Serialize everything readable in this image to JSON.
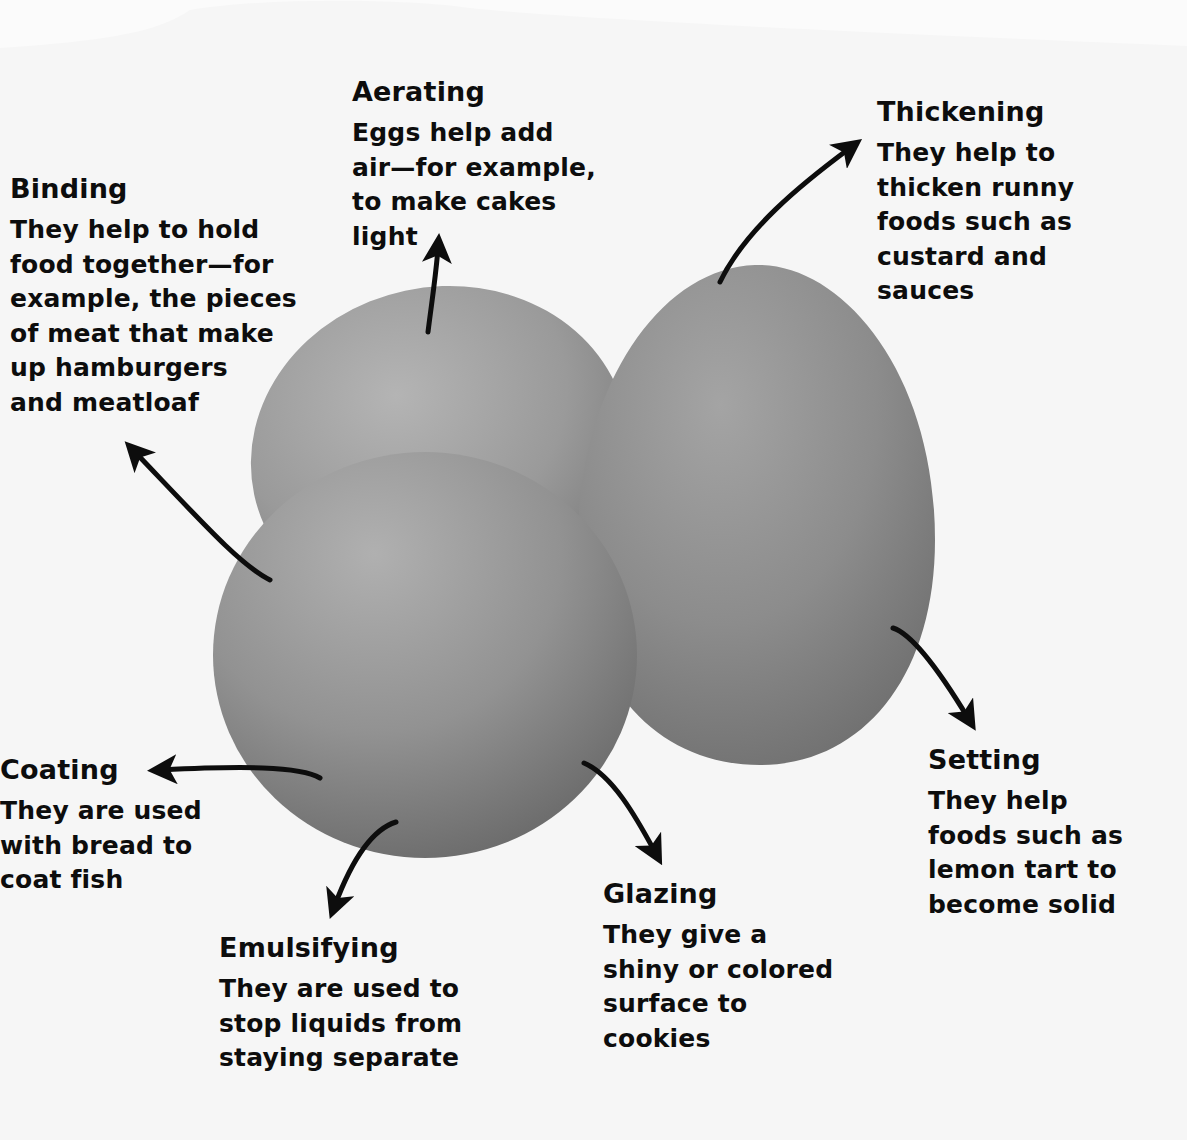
{
  "diagram": {
    "subject": "Eggs",
    "colors": {
      "background": "#fbfbfb",
      "egg_light": "#a9a9a9",
      "egg_mid": "#8e8e8e",
      "egg_dark": "#707070",
      "arrow": "#0d0d0d",
      "text": "#0d0d0d"
    },
    "labels": [
      {
        "id": "aerating",
        "title": "Aerating",
        "description": "Eggs help add\nair—for example,\nto make cakes\nlight"
      },
      {
        "id": "thickening",
        "title": "Thickening",
        "description": "They help to\nthicken runny\nfoods such as\ncustard and\nsauces"
      },
      {
        "id": "binding",
        "title": "Binding",
        "description": "They help to hold\nfood together—for\nexample, the pieces\nof meat that make\nup hamburgers\nand meatloaf"
      },
      {
        "id": "coating",
        "title": "Coating",
        "description": "They are used\nwith bread to\ncoat fish"
      },
      {
        "id": "emulsifying",
        "title": "Emulsifying",
        "description": "They are used to\nstop liquids from\nstaying separate"
      },
      {
        "id": "glazing",
        "title": "Glazing",
        "description": "They give a\nshiny or colored\nsurface to\ncookies"
      },
      {
        "id": "setting",
        "title": "Setting",
        "description": "They help\nfoods such as\nlemon tart to\nbecome solid"
      }
    ],
    "arrows": [
      {
        "id": "arrow-aerating",
        "from": "back egg top",
        "to": "Aerating label",
        "direction": "up"
      },
      {
        "id": "arrow-thickening",
        "from": "right egg top",
        "to": "Thickening label",
        "direction": "up-right"
      },
      {
        "id": "arrow-binding",
        "from": "front egg left",
        "to": "Binding label",
        "direction": "up-left"
      },
      {
        "id": "arrow-coating",
        "from": "front egg left-bottom",
        "to": "Coating label",
        "direction": "left"
      },
      {
        "id": "arrow-emulsifying",
        "from": "front egg bottom",
        "to": "Emulsifying label",
        "direction": "down-left"
      },
      {
        "id": "arrow-glazing",
        "from": "front egg bottom-right",
        "to": "Glazing label",
        "direction": "down-right"
      },
      {
        "id": "arrow-setting",
        "from": "right egg bottom-right",
        "to": "Setting label",
        "direction": "down-right"
      }
    ],
    "eggs": [
      {
        "id": "egg-back",
        "position": "back-left"
      },
      {
        "id": "egg-right",
        "position": "right, upright"
      },
      {
        "id": "egg-front",
        "position": "front-left"
      }
    ]
  }
}
